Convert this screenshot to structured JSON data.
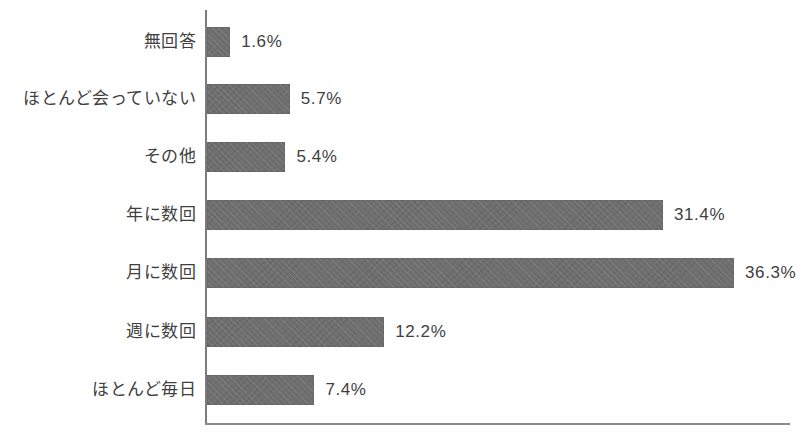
{
  "chart_data": {
    "type": "bar",
    "orientation": "horizontal",
    "title": "",
    "subtitle": "",
    "xlabel": "",
    "ylabel": "",
    "grid": false,
    "legend": false,
    "axis_ticks_visible": false,
    "value_suffix": "%",
    "xlim": [
      0,
      40
    ],
    "categories": [
      "無回答",
      "ほとんど会っていない",
      "その他",
      "年に数回",
      "月に数回",
      "週に数回",
      "ほとんど毎日"
    ],
    "values": [
      1.6,
      5.7,
      5.4,
      31.4,
      36.3,
      12.2,
      7.4
    ],
    "data_labels": [
      "1.6%",
      "5.7%",
      "5.4%",
      "31.4%",
      "36.3%",
      "12.2%",
      "7.4%"
    ],
    "bar_color": "#6e6e6e",
    "axis_color": "#7c7c7c",
    "background_color": "#ffffff",
    "text_color": "#3f3f3f"
  },
  "layout": {
    "axis_origin_x": 206,
    "axis_top_y": 10,
    "axis_bottom_y": 424,
    "axis_right_x": 790,
    "px_per_unit": 14.52,
    "bar_height": 30,
    "row_tops": [
      27,
      84,
      142,
      200,
      258,
      317,
      375
    ]
  }
}
